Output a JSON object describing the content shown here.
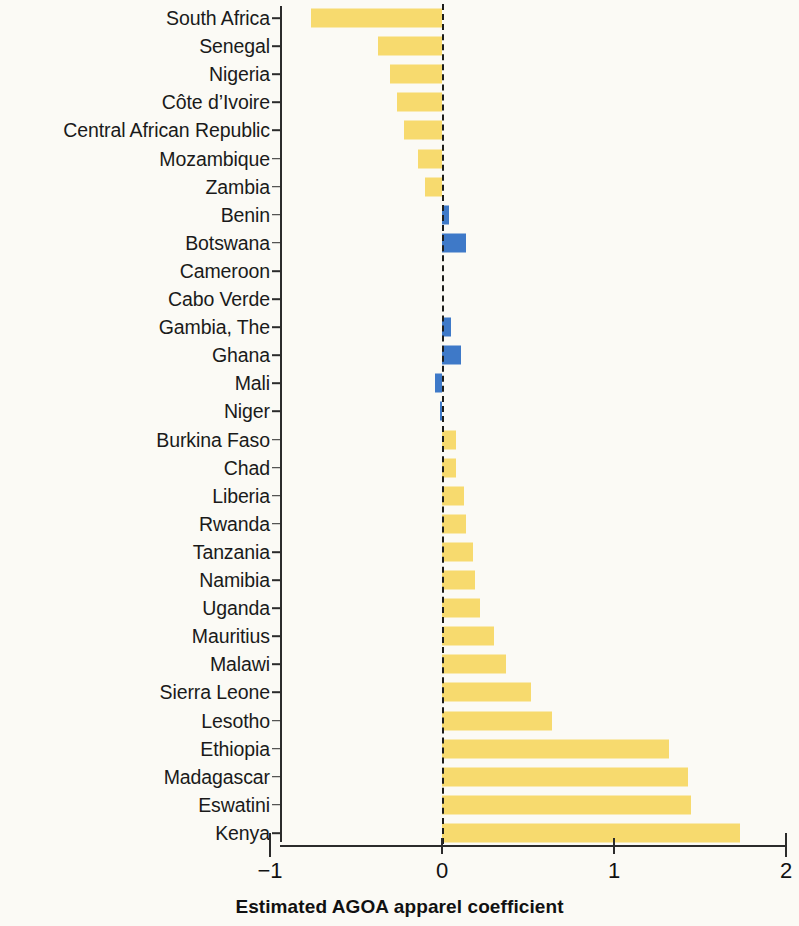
{
  "chart_data": {
    "type": "bar",
    "orientation": "horizontal",
    "title": "",
    "xlabel": "Estimated AGOA apparel coefficient",
    "ylabel": "",
    "xlim": [
      -1,
      2
    ],
    "xticks": [
      -1,
      0,
      1,
      2
    ],
    "xtick_labels": [
      "−1",
      "0",
      "1",
      "2"
    ],
    "grid": false,
    "legend": null,
    "zero_reference_line": true,
    "colors": {
      "yellow": "#F7DA6E",
      "blue": "#3E79C8",
      "axis": "#2b2b2b",
      "text": "#1a1a1a",
      "background": "#fbfaf5"
    },
    "categories": [
      "South Africa",
      "Senegal",
      "Nigeria",
      "Côte d’Ivoire",
      "Central African Republic",
      "Mozambique",
      "Zambia",
      "Benin",
      "Botswana",
      "Cameroon",
      "Cabo Verde",
      "Gambia, The",
      "Ghana",
      "Mali",
      "Niger",
      "Burkina Faso",
      "Chad",
      "Liberia",
      "Rwanda",
      "Tanzania",
      "Namibia",
      "Uganda",
      "Mauritius",
      "Malawi",
      "Sierra Leone",
      "Lesotho",
      "Ethiopia",
      "Madagascar",
      "Eswatini",
      "Kenya"
    ],
    "values": [
      -0.76,
      -0.37,
      -0.3,
      -0.26,
      -0.22,
      -0.14,
      -0.1,
      0.04,
      0.14,
      0.0,
      0.0,
      0.05,
      0.11,
      -0.04,
      -0.01,
      0.08,
      0.08,
      0.13,
      0.14,
      0.18,
      0.19,
      0.22,
      0.3,
      0.37,
      0.52,
      0.64,
      1.32,
      1.43,
      1.45,
      1.73
    ],
    "bar_colors": [
      "yellow",
      "yellow",
      "yellow",
      "yellow",
      "yellow",
      "yellow",
      "yellow",
      "blue",
      "blue",
      "blue",
      "blue",
      "blue",
      "blue",
      "blue",
      "blue",
      "yellow",
      "yellow",
      "yellow",
      "yellow",
      "yellow",
      "yellow",
      "yellow",
      "yellow",
      "yellow",
      "yellow",
      "yellow",
      "yellow",
      "yellow",
      "yellow",
      "yellow"
    ]
  }
}
